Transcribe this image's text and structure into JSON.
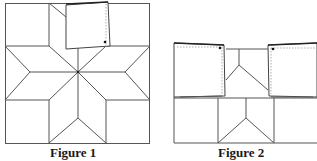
{
  "figures": [
    {
      "id": "figure-1",
      "caption": "Figure 1",
      "description": "Eight-pointed star quilt block inside a square, with the top-middle square piece folded/lifted showing a dot marker"
    },
    {
      "id": "figure-2",
      "caption": "Figure 2",
      "description": "Quilt block with two square panels on the top row folded back, dotted fold lines and dot markers visible; lower row shows triangle/diamond seams"
    }
  ],
  "colors": {
    "line": "#555555",
    "dark_line": "#222222",
    "dotted_line": "#999999",
    "background": "#ffffff",
    "caption_text": "#1a1a1a"
  }
}
